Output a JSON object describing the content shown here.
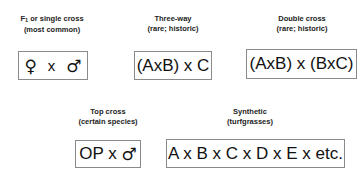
{
  "crosses": [
    {
      "title_pre": "F",
      "title_sub": "1",
      "title_post": " or single cross",
      "subtitle": "(most common)",
      "formula": {
        "female": "♀",
        "x": "x",
        "male": "♂"
      }
    },
    {
      "title": "Three-way",
      "subtitle": "(rare; historic)",
      "formula": "(AxB) x C"
    },
    {
      "title": "Double cross",
      "subtitle": "(rare; historic)",
      "formula": "(AxB) x (BxC)"
    },
    {
      "title": "Top cross",
      "subtitle": "(certain species)",
      "formula_text": "OP x ",
      "formula_male": "♂"
    },
    {
      "title": "Synthetic",
      "subtitle": "(turfgrasses)",
      "formula": "A x B x C x D x E x etc."
    }
  ]
}
